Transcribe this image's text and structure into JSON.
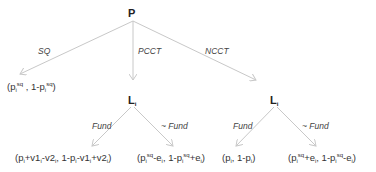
{
  "nodes": {
    "root": "P",
    "left_chance": "L",
    "right_chance": "L",
    "chance_sub": "i"
  },
  "edge_labels": {
    "sq": "SQ",
    "pcct": "PCCT",
    "ncct": "NCCT",
    "fund_left": "Fund",
    "notfund_left": "~ Fund",
    "fund_right": "Fund",
    "notfund_right": "~ Fund"
  },
  "payoffs": {
    "sq": "(p_i^sq , 1-p_i^sq)",
    "pcct_fund": "(p_i+v1_i-v2_i, 1-p_i-v1_i+v2_i)",
    "pcct_notfund": "(p_i^sq-e_i, 1-p_i^sq+e_i)",
    "ncct_fund": "(p_i, 1-p_i)",
    "ncct_notfund": "(p_i^sq+e_i, 1-p_i^sq-e_i)"
  },
  "colors": {
    "edge": "#c8c8c8",
    "text": "#333333"
  }
}
